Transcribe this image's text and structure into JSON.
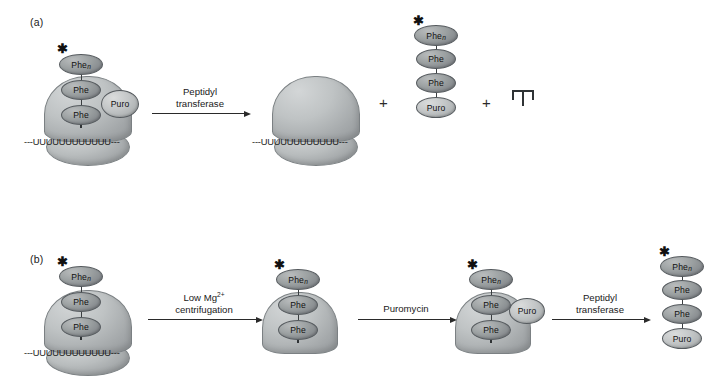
{
  "figure": {
    "panels": [
      {
        "id": "a",
        "label": "(a)",
        "reaction": {
          "caption_line1": "Peptidyl",
          "caption_line2": "transferase"
        },
        "reactant": {
          "peptide": [
            {
              "label": "Phe",
              "subscript": "n",
              "radiolabeled": true
            },
            {
              "label": "Phe",
              "subscript": "",
              "radiolabeled": false
            },
            {
              "label": "Phe",
              "subscript": "",
              "radiolabeled": false
            }
          ],
          "puromycin": {
            "label": "Puro"
          },
          "trna": "tRNA-glyph",
          "mrna": "---UUUUUUUUUUUU---",
          "ribosome": "70S-ribosome"
        },
        "products": {
          "plus_1": "+",
          "plus_2": "+",
          "ribosome_mrna": "---UUUUUUUUUUUU---",
          "released_peptide": [
            {
              "label": "Phe",
              "subscript": "n",
              "radiolabeled": true
            },
            {
              "label": "Phe",
              "subscript": "",
              "radiolabeled": false
            },
            {
              "label": "Phe",
              "subscript": "",
              "radiolabeled": false
            },
            {
              "label": "Puro",
              "subscript": "",
              "radiolabeled": false
            }
          ],
          "free_trna": "tRNA-glyph"
        }
      },
      {
        "id": "b",
        "label": "(b)",
        "steps": [
          {
            "caption_line1": "Low Mg",
            "caption_superscript": "2+",
            "caption_line2": "centrifugation"
          },
          {
            "caption_line1": "Puromycin",
            "caption_line2": ""
          },
          {
            "caption_line1": "Peptidyl",
            "caption_line2": "transferase"
          }
        ],
        "stage_1": {
          "peptide": [
            {
              "label": "Phe",
              "subscript": "n",
              "radiolabeled": true
            },
            {
              "label": "Phe",
              "subscript": "",
              "radiolabeled": false
            },
            {
              "label": "Phe",
              "subscript": "",
              "radiolabeled": false
            }
          ],
          "trna": "tRNA-glyph",
          "mrna": "---UUUUUUUUUUUU---",
          "ribosome": "70S-ribosome"
        },
        "stage_2": {
          "peptide": [
            {
              "label": "Phe",
              "subscript": "n",
              "radiolabeled": true
            },
            {
              "label": "Phe",
              "subscript": "",
              "radiolabeled": false
            },
            {
              "label": "Phe",
              "subscript": "",
              "radiolabeled": false
            }
          ],
          "trna": "tRNA-glyph",
          "ribosome": "50S-subunit"
        },
        "stage_3": {
          "peptide": [
            {
              "label": "Phe",
              "subscript": "n",
              "radiolabeled": true
            },
            {
              "label": "Phe",
              "subscript": "",
              "radiolabeled": false
            },
            {
              "label": "Phe",
              "subscript": "",
              "radiolabeled": false
            }
          ],
          "puromycin": {
            "label": "Puro"
          },
          "trna": "tRNA-glyph",
          "ribosome": "50S-subunit"
        },
        "stage_4": {
          "released_peptide": [
            {
              "label": "Phe",
              "subscript": "n",
              "radiolabeled": true
            },
            {
              "label": "Phe",
              "subscript": "",
              "radiolabeled": false
            },
            {
              "label": "Phe",
              "subscript": "",
              "radiolabeled": false
            },
            {
              "label": "Puro",
              "subscript": "",
              "radiolabeled": false
            }
          ]
        }
      }
    ],
    "symbols": {
      "radioactive_star": "✱",
      "plus": "+"
    },
    "colors": {
      "background": "#ffffff",
      "ink": "#1a1a1a",
      "ribosome_gray": "#b9bdbe",
      "phe_gray": "#9ba0a1",
      "puro_gray": "#c3c6c7",
      "outline": "#7b8083"
    }
  }
}
